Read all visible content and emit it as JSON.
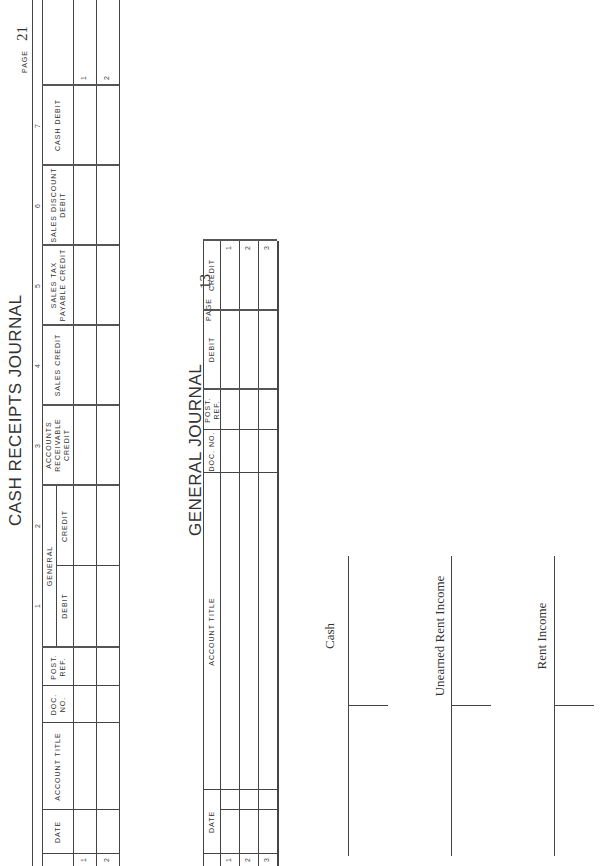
{
  "cash_receipts_journal": {
    "title": "CASH RECEIPTS JOURNAL",
    "page_label": "PAGE",
    "page_number": "21",
    "column_numbers": [
      "1",
      "2",
      "3",
      "4",
      "5",
      "6",
      "7"
    ],
    "group_header": "GENERAL",
    "headers": {
      "date": "DATE",
      "account_title": "ACCOUNT TITLE",
      "doc_no": "DOC. NO.",
      "post_ref": "POST. REF.",
      "general_debit": "DEBIT",
      "general_credit": "CREDIT",
      "accounts_receivable_credit": "ACCOUNTS RECEIVABLE CREDIT",
      "sales_credit": "SALES CREDIT",
      "sales_tax_payable_credit": "SALES TAX PAYABLE CREDIT",
      "sales_discount_debit": "SALES DISCOUNT DEBIT",
      "cash_debit": "CASH DEBIT"
    },
    "rows": [
      "1",
      "2"
    ]
  },
  "general_journal": {
    "title": "GENERAL JOURNAL",
    "page_label": "PAGE",
    "page_number": "13",
    "headers": {
      "date": "DATE",
      "account_title": "ACCOUNT TITLE",
      "doc_no": "DOC. NO.",
      "post_ref": "POST. REF.",
      "debit": "DEBIT",
      "credit": "CREDIT"
    },
    "rows": [
      "1",
      "2",
      "3"
    ]
  },
  "t_accounts": [
    {
      "title": "Cash"
    },
    {
      "title": "Unearned Rent Income"
    },
    {
      "title": "Rent Income"
    }
  ]
}
